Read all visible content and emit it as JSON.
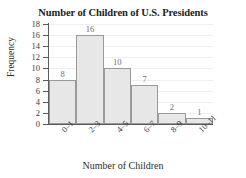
{
  "chart_data": {
    "type": "bar",
    "title": "Number of Children of U.S. Presidents",
    "xlabel": "Number of Children",
    "ylabel": "Frequency",
    "categories": [
      "0–1",
      "2–3",
      "4–5",
      "6–7",
      "8–9",
      "10–11"
    ],
    "values": [
      8,
      16,
      10,
      7,
      2,
      1
    ],
    "value_labels": [
      "8",
      "16",
      "10",
      "7",
      "2",
      "1"
    ],
    "ylim": [
      0,
      18
    ],
    "ytick_values": [
      0,
      2,
      4,
      6,
      8,
      10,
      12,
      14,
      16,
      18
    ],
    "ytick_labels": [
      "0",
      "2",
      "4",
      "6",
      "8",
      "10",
      "12",
      "14",
      "16",
      "18"
    ],
    "grid": true,
    "legend": "none",
    "bar_fill_color": "#e7e7e7",
    "bar_border_color": "#9a9a9a",
    "axis_color": "#5a5a5a",
    "grid_color": "#efefef",
    "xtick_rotation": -45
  }
}
